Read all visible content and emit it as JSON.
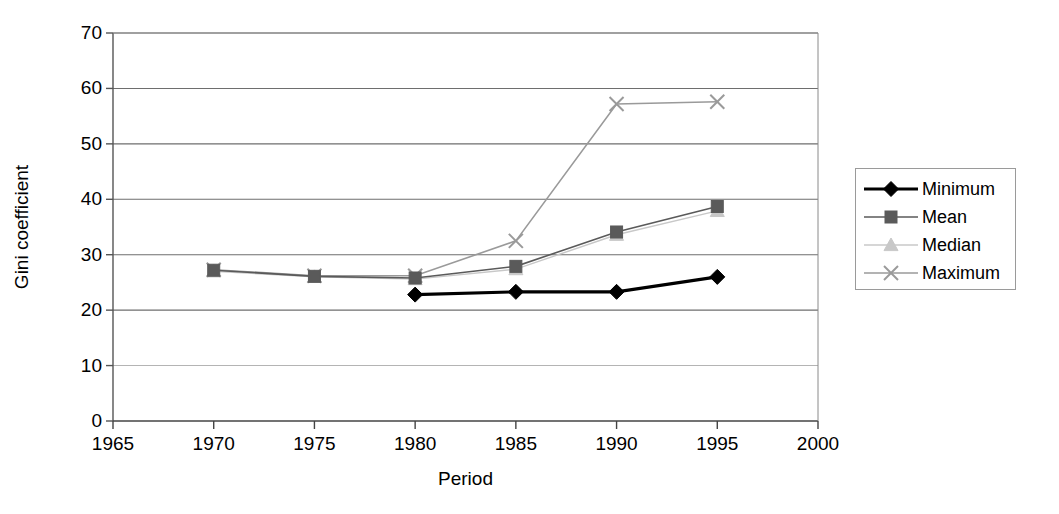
{
  "chart_data": {
    "type": "line",
    "title": "",
    "xlabel": "Period",
    "ylabel": "Gini coefficient",
    "x": [
      1970,
      1975,
      1980,
      1985,
      1990,
      1995
    ],
    "xlim": [
      1965,
      2000
    ],
    "ylim": [
      0,
      70
    ],
    "xticks": [
      "1965",
      "1970",
      "1975",
      "1980",
      "1985",
      "1990",
      "1995",
      "2000"
    ],
    "yticks": [
      "0",
      "10",
      "20",
      "30",
      "40",
      "50",
      "60",
      "70"
    ],
    "grid": "horizontal",
    "legend_position": "right",
    "series": [
      {
        "name": "Minimum",
        "marker": "diamond",
        "color": "#000000",
        "values": [
          null,
          null,
          22.8,
          23.3,
          23.3,
          26.0
        ]
      },
      {
        "name": "Mean",
        "marker": "square",
        "color": "#5a5a5a",
        "values": [
          27.2,
          26.1,
          25.8,
          27.9,
          34.1,
          38.7
        ]
      },
      {
        "name": "Median",
        "marker": "triangle",
        "color": "#c8c8c8",
        "values": [
          27.0,
          26.0,
          25.6,
          27.4,
          33.6,
          37.9
        ]
      },
      {
        "name": "Maximum",
        "marker": "x",
        "color": "#9a9a9a",
        "values": [
          27.3,
          26.2,
          26.2,
          32.5,
          57.2,
          57.6
        ]
      }
    ]
  },
  "axes": {
    "ylabel": "Gini coefficient",
    "xlabel": "Period"
  },
  "legend": {
    "items": [
      {
        "label": "Minimum"
      },
      {
        "label": "Mean"
      },
      {
        "label": "Median"
      },
      {
        "label": "Maximum"
      }
    ]
  }
}
